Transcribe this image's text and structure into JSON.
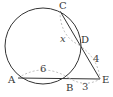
{
  "diagram": {
    "type": "circle-secant-geometry",
    "colors": {
      "stroke": "#333333",
      "dashed": "#aaaaaa",
      "background": "#ffffff"
    },
    "circle": {
      "cx": 43,
      "cy": 46,
      "r": 38
    },
    "points": {
      "A": {
        "label": "A",
        "x": 18,
        "y": 78
      },
      "B": {
        "label": "B",
        "x": 69,
        "y": 78
      },
      "C": {
        "label": "C",
        "x": 60,
        "y": 11
      },
      "D": {
        "label": "D",
        "x": 79,
        "y": 45
      },
      "E": {
        "label": "E",
        "x": 100,
        "y": 79
      }
    },
    "segments": [
      {
        "from": "A",
        "to": "E"
      },
      {
        "from": "C",
        "to": "E"
      }
    ],
    "measures": {
      "AB": "6",
      "BE": "3",
      "DE": "4",
      "CD": "x"
    }
  }
}
